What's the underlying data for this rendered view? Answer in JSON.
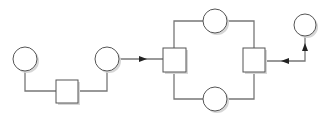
{
  "diagram": {
    "width": 334,
    "height": 120,
    "colors": {
      "stroke": "#555555",
      "line": "#777777",
      "fill": "#ffffff",
      "shadow": "#d6d6d6",
      "arrow": "#222222"
    },
    "nodes": [
      {
        "id": "circle-1",
        "shape": "circle",
        "cx": 25,
        "cy": 59,
        "r": 12
      },
      {
        "id": "square-1",
        "shape": "square",
        "x": 56,
        "y": 80,
        "w": 22,
        "h": 23
      },
      {
        "id": "circle-2",
        "shape": "circle",
        "cx": 107,
        "cy": 59,
        "r": 12
      },
      {
        "id": "square-2",
        "shape": "square",
        "x": 163,
        "y": 48,
        "w": 23,
        "h": 24
      },
      {
        "id": "circle-3",
        "shape": "circle",
        "cx": 215,
        "cy": 21,
        "r": 12
      },
      {
        "id": "circle-4",
        "shape": "circle",
        "cx": 215,
        "cy": 99,
        "r": 12
      },
      {
        "id": "square-3",
        "shape": "square",
        "x": 243,
        "y": 48,
        "w": 22,
        "h": 24
      },
      {
        "id": "circle-5",
        "shape": "circle",
        "cx": 305,
        "cy": 25,
        "r": 11
      }
    ],
    "edges": [
      {
        "id": "edge-c1-s1",
        "points": "25,71 25,91 56,91",
        "arrow": null
      },
      {
        "id": "edge-s1-c2",
        "points": "78,91 107,91 107,71",
        "arrow": null
      },
      {
        "id": "edge-c2-s2",
        "points": "119,59 163,59",
        "arrow": {
          "x": 143,
          "y": 59,
          "dir": "right"
        }
      },
      {
        "id": "edge-s2-c3",
        "points": "174,48 174,21 203,21",
        "arrow": null
      },
      {
        "id": "edge-c3-s3",
        "points": "227,21 254,21 254,48",
        "arrow": null
      },
      {
        "id": "edge-s2-c4",
        "points": "174,72 174,99 203,99",
        "arrow": null
      },
      {
        "id": "edge-c4-s3",
        "points": "227,99 254,99 254,72",
        "arrow": null
      },
      {
        "id": "edge-c5-s3",
        "points": "305,36 305,61 265,61",
        "arrow": {
          "x": 285,
          "y": 61,
          "dir": "left"
        },
        "arrow2": {
          "x": 305,
          "y": 47,
          "dir": "up"
        }
      }
    ]
  }
}
